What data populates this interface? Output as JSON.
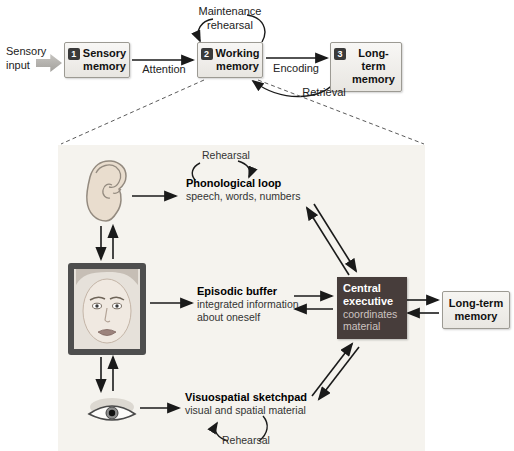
{
  "top_flow": {
    "sensory_input": "Sensory input",
    "boxes": [
      {
        "num": "1",
        "label": "Sensory memory"
      },
      {
        "num": "2",
        "label": "Working memory"
      },
      {
        "num": "3",
        "label": "Long-term memory"
      }
    ],
    "loop_label": "Maintenance rehearsal",
    "attention": "Attention",
    "encoding": "Encoding",
    "retrieval": "Retrieval"
  },
  "detail": {
    "phonological": {
      "rehearsal": "Rehearsal",
      "title": "Phonological loop",
      "desc": "speech, words, numbers"
    },
    "episodic": {
      "title": "Episodic buffer",
      "desc": "integrated information about oneself"
    },
    "visuospatial": {
      "title": "Visuospatial sketchpad",
      "desc": "visual and spatial material",
      "rehearsal": "Rehearsal"
    },
    "central": {
      "title": "Central executive",
      "desc": "coordinates material"
    },
    "long_term": {
      "label": "Long-term memory"
    }
  },
  "colors": {
    "panel_bg": "#f5f3ee",
    "central_bg": "#473d3b",
    "central_text": "#ffffff",
    "central_subtext": "#cdc3c0",
    "box_border": "#9c9a93",
    "badge_bg": "#3a3a3a",
    "arrow": "#1a1a1a"
  }
}
